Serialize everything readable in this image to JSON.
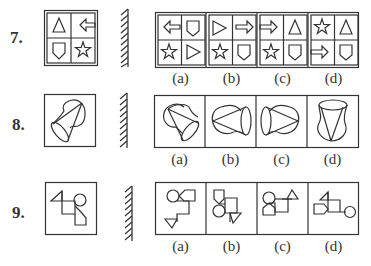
{
  "questions": [
    {
      "number": "7.",
      "question_figure": [
        "triangle",
        "left-arrow",
        "shield",
        "star"
      ],
      "options": [
        {
          "label": "(a)",
          "cells": [
            "left-arrow",
            "shield",
            "star",
            "right-triangle"
          ]
        },
        {
          "label": "(b)",
          "cells": [
            "right-triangle",
            "right-arrow",
            "star",
            "shield"
          ]
        },
        {
          "label": "(c)",
          "cells": [
            "right-arrow",
            "triangle",
            "star",
            "shield"
          ]
        },
        {
          "label": "(d)",
          "cells": [
            "star",
            "triangle",
            "right-arrow",
            "shield"
          ]
        }
      ]
    },
    {
      "number": "8.",
      "question_figure": "cone-with-cap-shape",
      "options": [
        {
          "label": "(a)"
        },
        {
          "label": "(b)"
        },
        {
          "label": "(c)"
        },
        {
          "label": "(d)"
        }
      ]
    },
    {
      "number": "9.",
      "question_figure": "triangle-square-circle-pentagon-chain",
      "options": [
        {
          "label": "(a)"
        },
        {
          "label": "(b)"
        },
        {
          "label": "(c)"
        },
        {
          "label": "(d)"
        }
      ]
    }
  ],
  "mirror_icon": "hatched-mirror-line",
  "colors": {
    "stroke": "#333333",
    "background": "#ffffff"
  }
}
